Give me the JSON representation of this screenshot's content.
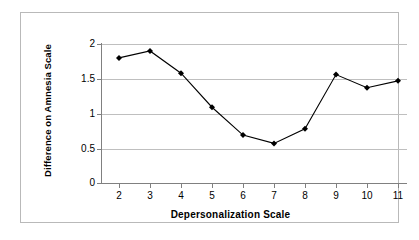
{
  "chart_data": {
    "type": "line",
    "title": "",
    "xlabel": "Depersonalization Scale",
    "ylabel": "Difference on Amnesia Scale",
    "categories": [
      2,
      3,
      4,
      5,
      6,
      7,
      8,
      9,
      10,
      11
    ],
    "x": [
      2,
      3,
      4,
      5,
      6,
      7,
      8,
      9,
      10,
      11
    ],
    "values": [
      1.8,
      1.9,
      1.58,
      1.09,
      0.69,
      0.57,
      0.78,
      1.56,
      1.37,
      1.47
    ],
    "series": [
      {
        "name": "Difference on Amnesia Scale",
        "values": [
          1.8,
          1.9,
          1.58,
          1.09,
          0.69,
          0.57,
          0.78,
          1.56,
          1.37,
          1.47
        ]
      }
    ],
    "xlim": [
      2,
      11
    ],
    "ylim": [
      0,
      2
    ],
    "ytick_labels": [
      "0",
      "0.5",
      "1",
      "1.5",
      "2"
    ],
    "ytick_values": [
      0,
      0.5,
      1,
      1.5,
      2
    ],
    "xtick_labels": [
      "2",
      "3",
      "4",
      "5",
      "6",
      "7",
      "8",
      "9",
      "10",
      "11"
    ],
    "grid": "horizontal",
    "legend": "none",
    "marker": "diamond",
    "line_color": "#000000",
    "marker_color": "#000000",
    "grid_color": "#bfbfbf",
    "axis_color": "#808080",
    "plot_background": "#ffffff",
    "border_color": "#b9b9b9"
  }
}
